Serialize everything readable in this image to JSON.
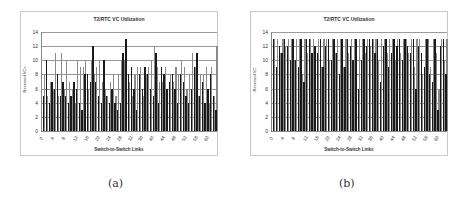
{
  "chart_data": [
    {
      "id": "a",
      "type": "bar",
      "title": "T2/RTC VC Utilization",
      "xlabel": "Switch-to-Switch Links",
      "ylabel": "Reserved VCs",
      "ylim": [
        0,
        14
      ],
      "yticks": [
        0,
        2,
        4,
        6,
        8,
        10,
        12,
        14
      ],
      "xticks": [
        "0",
        "4",
        "8",
        "12",
        "16",
        "20",
        "24",
        "28",
        "32",
        "36",
        "40",
        "44",
        "48",
        "52",
        "56",
        "60"
      ],
      "grid": true,
      "legend": "none",
      "categories_count": 64,
      "series": [
        {
          "name": "series-dark",
          "color": "#1a1a1a",
          "values": [
            5,
            10,
            4,
            7,
            6,
            8,
            5,
            7,
            5,
            4,
            5,
            7,
            6,
            4,
            3,
            8,
            8,
            7,
            12,
            7,
            5,
            4,
            10,
            5,
            4,
            6,
            4,
            3,
            4,
            11,
            13,
            8,
            9,
            6,
            3,
            8,
            6,
            9,
            8,
            6,
            5,
            11,
            4,
            9,
            8,
            6,
            7,
            8,
            6,
            4,
            8,
            7,
            5,
            4,
            6,
            9,
            11,
            5,
            7,
            4,
            6,
            8,
            5,
            3
          ]
        },
        {
          "name": "series-gray",
          "color": "#8a8a8a",
          "values": [
            8,
            5,
            7,
            6,
            11,
            5,
            11,
            6,
            10,
            7,
            6,
            4,
            10,
            9,
            9,
            10,
            6,
            10,
            8,
            9,
            10,
            7,
            6,
            5,
            7,
            8,
            5,
            8,
            10,
            10,
            8,
            7,
            5,
            8,
            9,
            9,
            5,
            8,
            9,
            10,
            12,
            9,
            7,
            7,
            9,
            6,
            8,
            7,
            9,
            8,
            10,
            9,
            6,
            8,
            11,
            9,
            5,
            8,
            8,
            9,
            4,
            9,
            5,
            12
          ]
        }
      ],
      "dark_overlay_values": [
        5,
        10,
        4,
        7,
        6,
        8,
        5,
        7,
        5,
        4,
        5,
        7,
        6,
        4,
        3,
        8,
        8,
        7,
        12,
        7,
        5,
        4,
        10,
        5,
        4,
        6,
        4,
        3,
        4,
        11,
        13,
        8,
        9,
        6,
        3,
        8,
        6,
        9,
        8,
        6,
        5,
        11,
        4,
        9,
        8,
        6,
        7,
        8,
        6,
        4,
        8,
        7,
        5,
        4,
        6,
        9,
        11,
        5,
        7,
        4,
        6,
        8,
        5,
        3
      ]
    },
    {
      "id": "b",
      "type": "bar",
      "title": "T2/RTC VC Utilization",
      "xlabel": "Switch-to-Switch Links",
      "ylabel": "Reserved VC",
      "ylim": [
        0,
        14
      ],
      "yticks": [
        0,
        2,
        4,
        6,
        8,
        10,
        12,
        14
      ],
      "xticks": [
        "0",
        "4",
        "8",
        "12",
        "16",
        "20",
        "24",
        "28",
        "32",
        "36",
        "40",
        "44",
        "48",
        "52",
        "56",
        "60"
      ],
      "grid": true,
      "legend": "none",
      "categories_count": 64,
      "series": [
        {
          "name": "series-dark",
          "color": "#1a1a1a",
          "values": [
            13,
            9,
            12,
            11,
            13,
            12,
            10,
            13,
            10,
            9,
            13,
            7,
            13,
            13,
            11,
            12,
            11,
            13,
            9,
            12,
            13,
            10,
            13,
            11,
            8,
            13,
            9,
            13,
            12,
            10,
            13,
            6,
            10,
            13,
            12,
            13,
            13,
            11,
            13,
            7,
            12,
            13,
            9,
            11,
            13,
            12,
            13,
            10,
            13,
            12,
            11,
            13,
            6,
            12,
            11,
            9,
            13,
            8,
            7,
            13,
            3,
            12,
            13,
            8
          ]
        },
        {
          "name": "series-gray",
          "color": "#8a8a8a",
          "values": [
            13,
            13,
            11,
            13,
            12,
            13,
            13,
            10,
            13,
            13,
            8,
            13,
            11,
            13,
            13,
            11,
            13,
            9,
            13,
            13,
            10,
            13,
            11,
            13,
            13,
            9,
            13,
            11,
            13,
            13,
            10,
            13,
            13,
            11,
            13,
            12,
            13,
            13,
            10,
            13,
            13,
            11,
            13,
            13,
            10,
            13,
            11,
            13,
            13,
            11,
            13,
            9,
            13,
            13,
            8,
            13,
            13,
            9,
            13,
            11,
            6,
            13,
            10,
            13
          ]
        }
      ]
    }
  ],
  "captions": [
    "(a)",
    "(b)"
  ]
}
